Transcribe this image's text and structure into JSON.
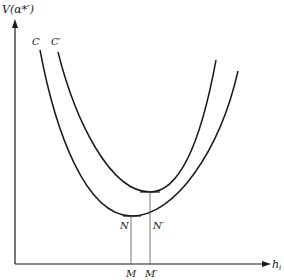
{
  "diagram": {
    "y_axis_label": "V(α*′)",
    "x_axis_label": "h",
    "x_axis_subscript": "i",
    "curves": [
      {
        "name": "C",
        "label": "C",
        "min_point_label": "N",
        "foot_label": "M"
      },
      {
        "name": "C-prime",
        "label": "C′",
        "min_point_label": "N′",
        "foot_label": "M′"
      }
    ],
    "colors": {
      "ink": "#1a1a1a",
      "guide": "#555555",
      "background": "#ffffff"
    }
  }
}
